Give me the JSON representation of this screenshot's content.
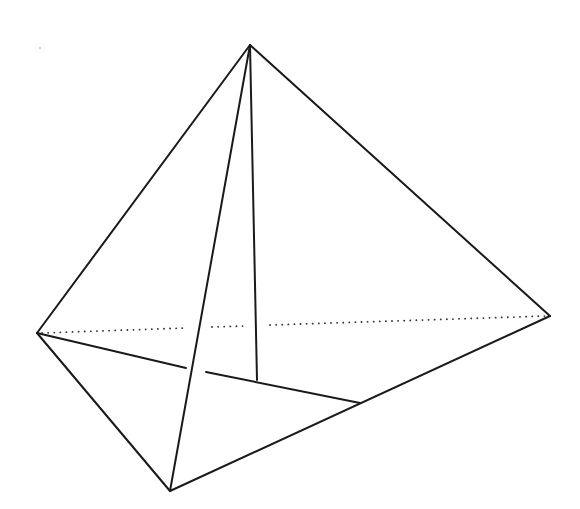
{
  "diagram": {
    "type": "tetrahedron",
    "stroke_color": "#1a1a1a",
    "background": "#ffffff",
    "vertices": {
      "apex": [
        250,
        45
      ],
      "left": [
        37,
        333
      ],
      "right": [
        550,
        316
      ],
      "bottom": [
        170,
        491
      ],
      "foot": [
        257,
        380
      ],
      "mid_br": [
        360,
        403
      ]
    },
    "edges": [
      {
        "name": "apex-left",
        "x1": 250,
        "y1": 45,
        "x2": 37,
        "y2": 333
      },
      {
        "name": "apex-right",
        "x1": 250,
        "y1": 45,
        "x2": 550,
        "y2": 316
      },
      {
        "name": "apex-bottom",
        "x1": 250,
        "y1": 45,
        "x2": 170,
        "y2": 491
      },
      {
        "name": "apex-foot",
        "x1": 250,
        "y1": 45,
        "x2": 257,
        "y2": 380
      },
      {
        "name": "left-bottom",
        "x1": 37,
        "y1": 333,
        "x2": 170,
        "y2": 491
      },
      {
        "name": "bottom-right",
        "x1": 170,
        "y1": 491,
        "x2": 550,
        "y2": 316
      },
      {
        "name": "left-midbr-a",
        "x1": 37,
        "y1": 333,
        "x2": 186,
        "y2": 368
      },
      {
        "name": "left-midbr-b",
        "x1": 206,
        "y1": 372,
        "x2": 360,
        "y2": 403
      }
    ],
    "hidden_edges": [
      {
        "name": "left-right-dotted-a",
        "x1": 42,
        "y1": 333,
        "x2": 185,
        "y2": 328
      },
      {
        "name": "left-right-dotted-b",
        "x1": 212,
        "y1": 327,
        "x2": 244,
        "y2": 326
      },
      {
        "name": "left-right-dotted-c",
        "x1": 270,
        "y1": 325,
        "x2": 546,
        "y2": 316
      }
    ]
  }
}
